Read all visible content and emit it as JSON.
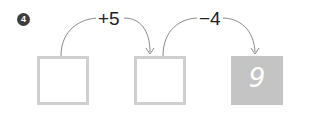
{
  "problem": {
    "number": "4",
    "steps": [
      {
        "operation": "+5"
      },
      {
        "operation": "−4"
      }
    ],
    "boxes": [
      {
        "value": "",
        "filled": false
      },
      {
        "value": "",
        "filled": false
      },
      {
        "value": "9",
        "filled": true
      }
    ]
  },
  "colors": {
    "box_border": "#cfcfcf",
    "box_fill": "#c4c4c4",
    "arc": "#8a8a8a",
    "badge": "#3d3d3d"
  }
}
